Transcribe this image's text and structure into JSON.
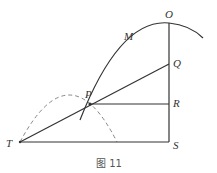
{
  "figure": {
    "caption": "图 11",
    "points": {
      "O": "O",
      "M": "M",
      "Q": "Q",
      "P": "P",
      "R": "R",
      "T": "T",
      "S": "S"
    },
    "colors": {
      "line": "#333333",
      "dashed": "#888888",
      "background": "#ffffff"
    }
  }
}
